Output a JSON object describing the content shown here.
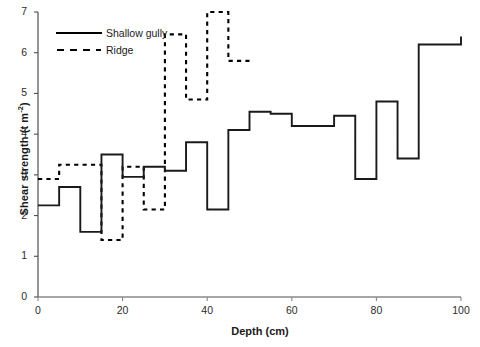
{
  "chart_data": {
    "type": "line",
    "title": "",
    "xlabel": "Depth (cm)",
    "ylabel": "Shear strength (t m-2)",
    "ylabel_base": "Shear strength (t m",
    "ylabel_sup": "-2",
    "ylabel_tail": ")",
    "xlim": [
      0,
      100
    ],
    "ylim": [
      0,
      7
    ],
    "grid": false,
    "legend_position": "top-left",
    "xticks": [
      0,
      20,
      40,
      60,
      80,
      100
    ],
    "yticks": [
      0,
      1,
      2,
      3,
      4,
      5,
      6,
      7
    ],
    "line_style": "step-post",
    "series": [
      {
        "name": "Shallow gully",
        "style": "solid",
        "color": "#000000",
        "x": [
          0,
          5,
          10,
          15,
          20,
          25,
          30,
          35,
          40,
          45,
          50,
          55,
          60,
          65,
          70,
          75,
          80,
          85,
          90,
          100
        ],
        "values": [
          2.25,
          2.7,
          1.6,
          3.5,
          2.95,
          3.2,
          3.1,
          3.8,
          2.15,
          4.1,
          4.55,
          4.5,
          4.2,
          4.2,
          4.45,
          2.9,
          4.8,
          3.4,
          6.2,
          6.4
        ]
      },
      {
        "name": "Ridge",
        "style": "dashed",
        "color": "#000000",
        "x": [
          0,
          5,
          10,
          15,
          20,
          25,
          30,
          35,
          40,
          45,
          50
        ],
        "values": [
          2.9,
          3.25,
          3.25,
          1.4,
          3.2,
          2.15,
          6.45,
          4.85,
          7.0,
          5.8,
          5.8
        ]
      }
    ]
  },
  "legend": {
    "items": [
      {
        "label": "Shallow gully",
        "style": "solid"
      },
      {
        "label": "Ridge",
        "style": "dashed"
      }
    ]
  },
  "axis": {
    "x_tick_labels": [
      "0",
      "20",
      "40",
      "60",
      "80",
      "100"
    ],
    "y_tick_labels": [
      "0",
      "1",
      "2",
      "3",
      "4",
      "5",
      "6",
      "7"
    ]
  }
}
